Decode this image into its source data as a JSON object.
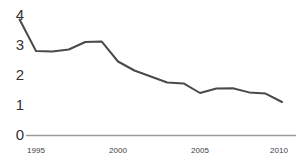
{
  "chart_data": {
    "type": "line",
    "title": "",
    "xlabel": "",
    "ylabel": "",
    "xlim": [
      1994,
      2010
    ],
    "ylim": [
      0,
      4
    ],
    "grid": false,
    "legend": null,
    "legend_position": "none",
    "line_color": "#4a4a4a",
    "axis_color": "#9a9a9a",
    "x": [
      1994,
      1995,
      1996,
      1997,
      1998,
      1999,
      2000,
      2001,
      2002,
      2003,
      2004,
      2005,
      2006,
      2007,
      2008,
      2009,
      2010
    ],
    "values": [
      3.85,
      2.8,
      2.78,
      2.85,
      3.1,
      3.12,
      2.45,
      2.15,
      1.95,
      1.75,
      1.72,
      1.4,
      1.55,
      1.56,
      1.42,
      1.38,
      1.1
    ],
    "series": [
      {
        "name": "series-1",
        "values": [
          3.85,
          2.8,
          2.78,
          2.85,
          3.1,
          3.12,
          2.45,
          2.15,
          1.95,
          1.75,
          1.72,
          1.4,
          1.55,
          1.56,
          1.42,
          1.38,
          1.1
        ]
      }
    ],
    "y_ticks": [
      0,
      1,
      2,
      3,
      4
    ],
    "y_tick_labels": [
      "0",
      "1",
      "2",
      "3",
      "4"
    ],
    "x_ticks": [
      1995,
      2000,
      2005,
      2010
    ],
    "x_tick_labels": [
      "1995",
      "2000",
      "2005",
      "2010"
    ]
  },
  "axis": {
    "y_labels": [
      "4",
      "3",
      "2",
      "1",
      "0"
    ],
    "x_labels": [
      "1995",
      "2000",
      "2005",
      "2010"
    ]
  }
}
